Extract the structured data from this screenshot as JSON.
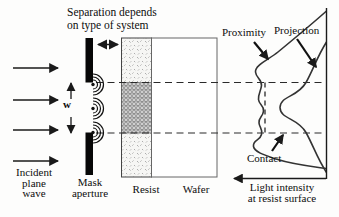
{
  "figure": {
    "top_annotation": "Separation depends\non type of system",
    "source": {
      "incident_label": "Incident\nplane\nwave",
      "mask_label": "Mask\naperture",
      "aperture_width_label": "w"
    },
    "stack": {
      "resist_label": "Resist",
      "wafer_label": "Wafer"
    },
    "intensity_plot": {
      "proximity_label": "Proximity",
      "projection_label": "Projection",
      "contact_label": "Contact",
      "axis_label": "Light intensity\nat resist surface"
    },
    "colors": {
      "line": "#1a1a1a",
      "curve": "#333333",
      "resist_speckle": "#9a9a9a",
      "exposed_band_fill": "#cfcfcf",
      "exposed_band_hatch": "#7d7d7d",
      "wafer_border": "#666666"
    }
  }
}
